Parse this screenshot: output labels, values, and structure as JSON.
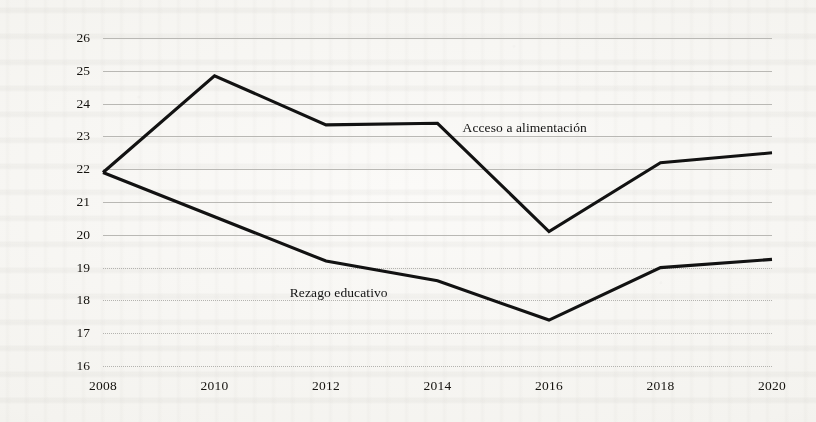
{
  "chart_data": {
    "type": "line",
    "title": "",
    "xlabel": "",
    "ylabel": "Proporción de población total",
    "categories": [
      2008,
      2010,
      2012,
      2014,
      2016,
      2018,
      2020
    ],
    "x_tick_labels": [
      "2008",
      "2010",
      "2012",
      "2014",
      "2016",
      "2018",
      "2020"
    ],
    "y_tick_labels": [
      "16",
      "17",
      "18",
      "19",
      "20",
      "21",
      "22",
      "23",
      "24",
      "25",
      "26"
    ],
    "y_ticks": [
      16,
      17,
      18,
      19,
      20,
      21,
      22,
      23,
      24,
      25,
      26
    ],
    "ylim": [
      16,
      26
    ],
    "xlim": [
      2008,
      2020
    ],
    "grid": true,
    "grid_axis": "y",
    "legend_position": "inline-annotations",
    "series": [
      {
        "name": "Acceso a alimentación",
        "color": "#121212",
        "values": [
          21.9,
          24.85,
          23.35,
          23.4,
          20.1,
          22.2,
          22.5
        ],
        "label": "Acceso a alimentación",
        "label_x": 2014.45,
        "label_y": 23.25
      },
      {
        "name": "Rezago educativo",
        "color": "#121212",
        "values": [
          21.9,
          20.55,
          19.2,
          18.6,
          17.4,
          19.0,
          19.25
        ],
        "label": "Rezago educativo",
        "label_x": 2011.35,
        "label_y": 18.22
      }
    ],
    "annotations": [
      {
        "text": "Acceso a alimentación"
      },
      {
        "text": "Rezago educativo"
      }
    ]
  },
  "figure": {
    "background_color": "#f7f6f3",
    "line_color": "#121212",
    "grid_color": "#b9b8b4",
    "text_color": "#15130f"
  }
}
